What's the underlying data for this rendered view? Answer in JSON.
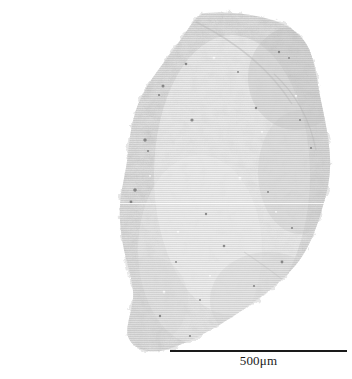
{
  "image": {
    "type": "micrograph",
    "subject": "tissue-section-specimen",
    "width": 352,
    "height": 379,
    "background_color": "#ffffff"
  },
  "specimen": {
    "label": "specimen",
    "description": "irregular elongated granular tissue fragment",
    "fill_color": "#e3e3e3",
    "edge_color": "#d2d2d2",
    "speck_color": "#6f6f6f",
    "bounds": {
      "left": 118,
      "top": 12,
      "right": 332,
      "bottom": 352
    },
    "seam": {
      "label": "stitching-seam",
      "y": 203,
      "x_start": 118,
      "x_end": 332,
      "color": "#ffffff"
    }
  },
  "scale_bar": {
    "label": "500μm",
    "value": 500,
    "unit": "μm",
    "bar_color": "#1a1a1a",
    "text_color": "#1b1b1b",
    "x_start": 170,
    "x_end": 347,
    "y": 357,
    "length_px": 177
  }
}
